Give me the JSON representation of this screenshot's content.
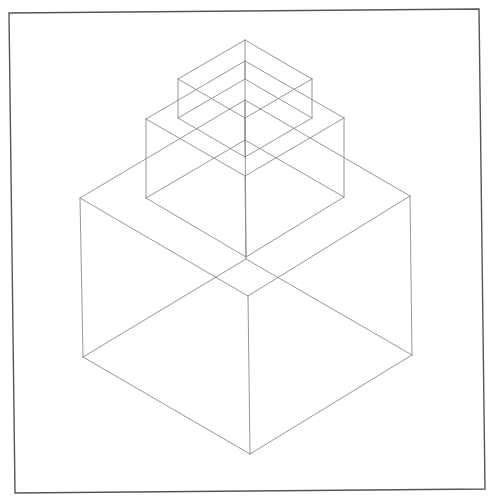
{
  "drawing": {
    "title": "Isometric wireframe of three stacked boxes",
    "colors": {
      "background": "#ffffff",
      "frame": "#555555",
      "lines": "#8a8a8a"
    },
    "frame": {
      "corners": [
        [
          9,
          13
        ],
        [
          479,
          9
        ],
        [
          485,
          489
        ],
        [
          15,
          493
        ]
      ]
    },
    "boxes": [
      {
        "name": "top-box",
        "top_face": [
          [
            245,
            40
          ],
          [
            312,
            79
          ],
          [
            245,
            118
          ],
          [
            178,
            79
          ]
        ],
        "bottom_face": [
          [
            245,
            79
          ],
          [
            312,
            118
          ],
          [
            245,
            157
          ],
          [
            178,
            118
          ]
        ]
      },
      {
        "name": "middle-box",
        "top_face": [
          [
            245,
            61
          ],
          [
            344,
            118
          ],
          [
            245,
            176
          ],
          [
            146,
            119
          ]
        ],
        "bottom_face": [
          [
            245,
            140
          ],
          [
            344,
            197
          ],
          [
            246,
            257
          ],
          [
            146,
            198
          ]
        ]
      },
      {
        "name": "bottom-box",
        "top_face": [
          [
            245,
            100
          ],
          [
            410,
            196
          ],
          [
            248,
            296
          ],
          [
            80,
            198
          ]
        ],
        "bottom_face": [
          [
            246,
            259
          ],
          [
            412,
            355
          ],
          [
            250,
            454
          ],
          [
            83,
            357
          ]
        ]
      }
    ]
  }
}
